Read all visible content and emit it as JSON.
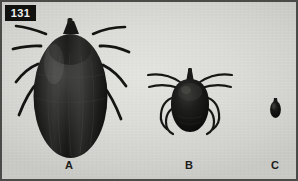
{
  "figure": {
    "plate_number": "131",
    "background_color": "#d9d9d6",
    "border_color": "#4a4a48",
    "specimen_color": "#121210",
    "width": 298,
    "height": 181
  },
  "specimens": [
    {
      "label": "A",
      "name": "engorged-adult-female-tick",
      "relative_size": "largest",
      "legs_visible": true,
      "body_shape": "oval-engorged"
    },
    {
      "label": "B",
      "name": "unengorged-adult-tick",
      "relative_size": "medium",
      "legs_visible": true,
      "body_shape": "teardrop"
    },
    {
      "label": "C",
      "name": "tick-nymph-or-larva",
      "relative_size": "smallest",
      "legs_visible": false,
      "body_shape": "small-oval"
    }
  ]
}
